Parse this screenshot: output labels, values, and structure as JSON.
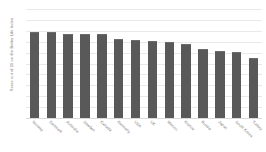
{
  "chart_data": {
    "type": "bar",
    "title": "",
    "xlabel": "",
    "ylabel": "Score out of 10 on the Better Life Index",
    "ylim": [
      0,
      10
    ],
    "grid": true,
    "legend": false,
    "bar_color": "#595959",
    "gridline_color": "#e9e9e9",
    "categories": [
      "Norway",
      "Denmark",
      "Australia",
      "Sweden",
      "Canada",
      "Germany",
      "USA",
      "UK",
      "Mexico",
      "France",
      "Russia",
      "Japan",
      "South Korea",
      "Turkey"
    ],
    "values": [
      7.8,
      7.8,
      7.6,
      7.6,
      7.6,
      7.2,
      7.1,
      7.0,
      6.9,
      6.7,
      6.2,
      6.1,
      6.0,
      5.4
    ],
    "yticks": [
      10,
      9,
      8,
      7,
      6,
      5,
      4,
      3,
      2,
      1,
      0
    ],
    "ytick_labels": [
      "10",
      "9",
      "8",
      "7",
      "6",
      "5",
      "4",
      "3",
      "2",
      "1",
      "0"
    ]
  },
  "caption": ""
}
